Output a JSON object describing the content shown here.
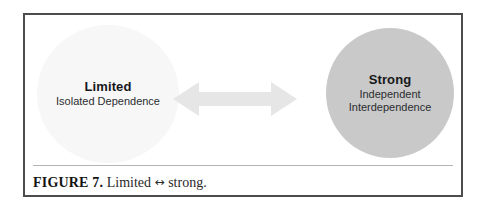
{
  "figure": {
    "nodes": [
      {
        "id": "limited",
        "title": "Limited",
        "subtitle_lines": [
          "Isolated Dependence"
        ],
        "fill_color": "#f7f7f7"
      },
      {
        "id": "strong",
        "title": "Strong",
        "subtitle_lines": [
          "Independent",
          "Interdependence"
        ],
        "fill_color": "#c9c9c9"
      }
    ],
    "connector": {
      "icon": "double-headed-arrow-icon",
      "color": "#e6e6e6",
      "direction": "bidirectional"
    },
    "caption": {
      "label": "FIGURE 7.",
      "text_before": " Limited ",
      "arrow_symbol": "↔",
      "text_after": " strong."
    },
    "border_color": "#4c4c4c",
    "rule_color": "#b4b4b4"
  }
}
